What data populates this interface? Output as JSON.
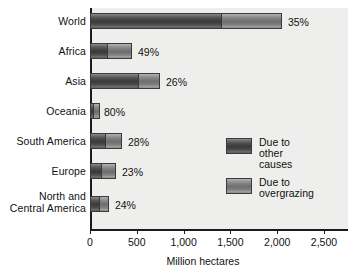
{
  "chart_data": {
    "type": "bar",
    "orientation": "horizontal",
    "stacked": true,
    "title": "",
    "xlabel": "Million hectares",
    "ylabel": "",
    "xlim": [
      0,
      2500
    ],
    "grid": false,
    "legend_position": "inside-right",
    "categories": [
      "World",
      "Africa",
      "Asia",
      "Oceania",
      "South America",
      "Europe",
      "North and\nCentral America"
    ],
    "tick_labels": [
      "0",
      "500",
      "1,000",
      "1,500",
      "2,000",
      "2,500"
    ],
    "tick_values": [
      0,
      500,
      1000,
      1500,
      2000,
      2500
    ],
    "series": [
      {
        "name": "Due to\nother causes",
        "color": "#4a4a4a",
        "values": [
          1400,
          183,
          513,
          15,
          162,
          118,
          95
        ]
      },
      {
        "name": "Due to\novergrazing",
        "color": "#8a8a8a",
        "values": [
          650,
          266,
          235,
          70,
          180,
          160,
          107
        ]
      }
    ],
    "totals": [
      2050,
      449,
      748,
      85,
      342,
      278,
      202
    ],
    "annotations": [
      "35%",
      "49%",
      "26%",
      "80%",
      "28%",
      "23%",
      "24%"
    ],
    "annotation_meaning": "share of degradation due to overgrazing"
  },
  "axis": {
    "x_title": "Million hectares"
  },
  "legend": {
    "items": [
      {
        "label": "Due to\nother causes",
        "color": "#4a4a4a"
      },
      {
        "label": "Due to\novergrazing",
        "color": "#8a8a8a"
      }
    ]
  },
  "colors": {
    "plot_background": "#eeeeec",
    "page_background": "#ffffff",
    "axis": "#1b1b1b",
    "text": "#111111",
    "series_other_causes": "#4a4a4a",
    "series_overgrazing": "#8a8a8a"
  }
}
